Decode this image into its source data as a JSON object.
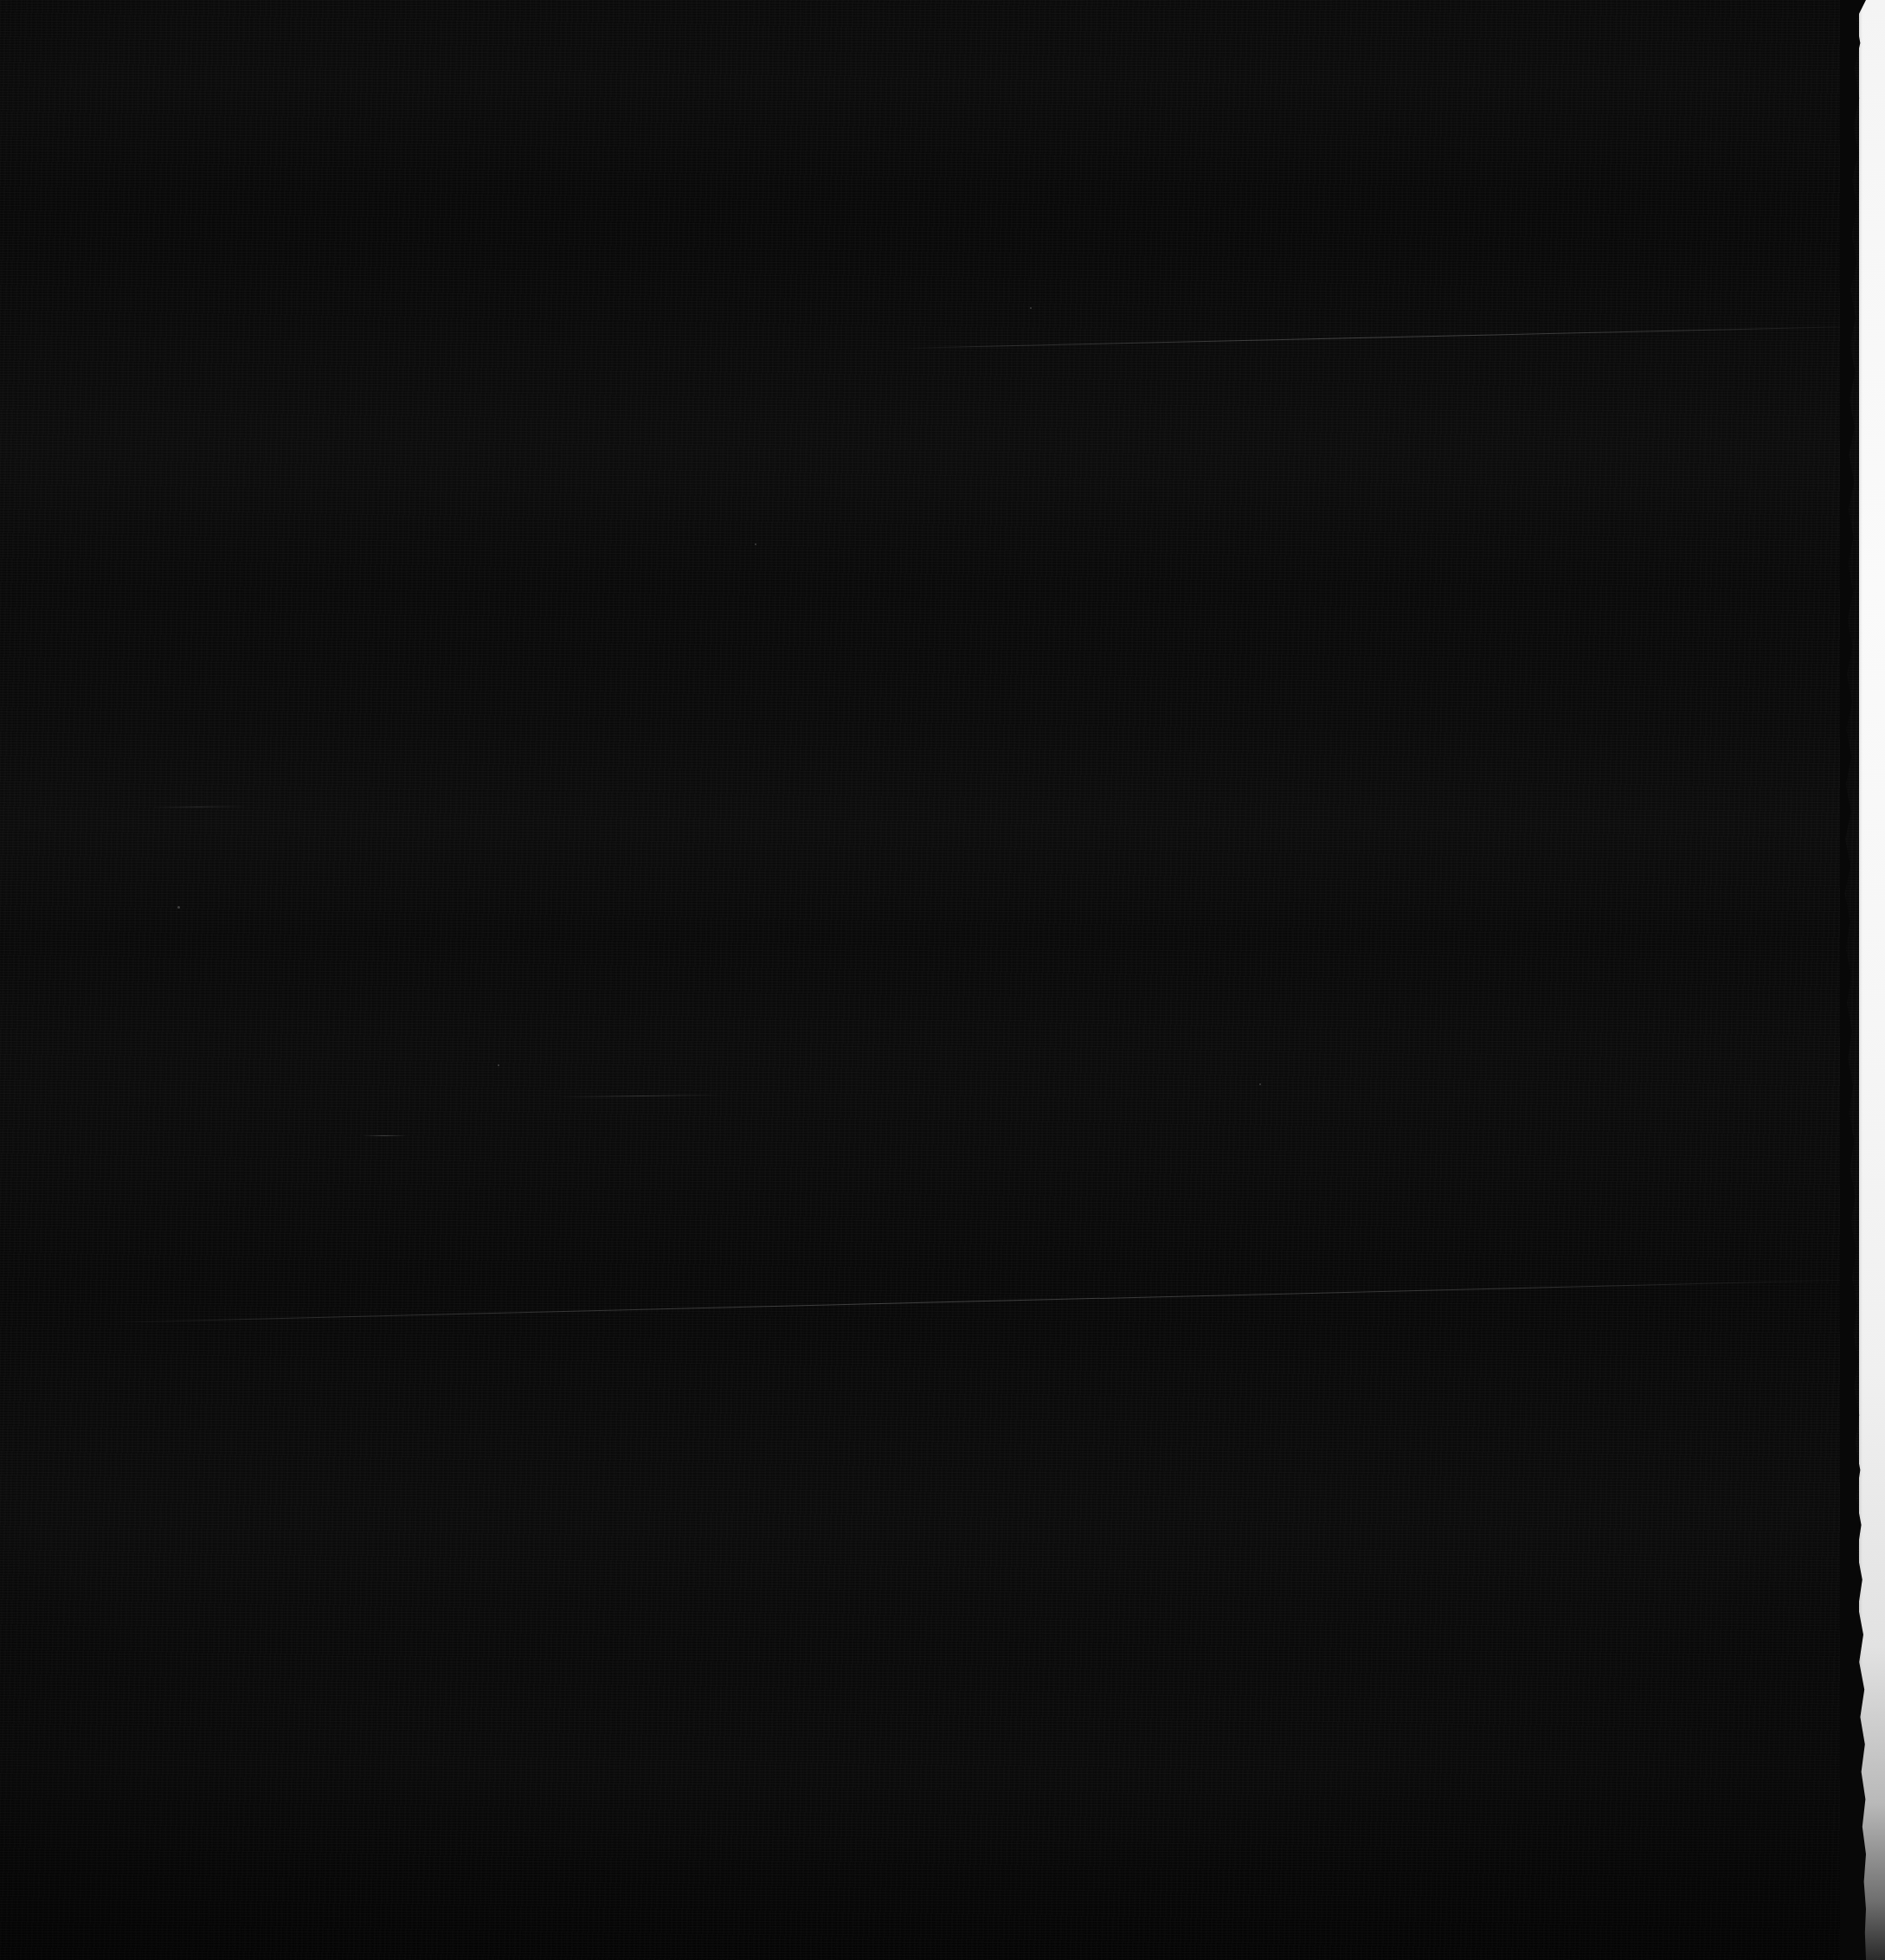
{
  "image": {
    "kind": "scanned-film-frame",
    "width": 2178,
    "height": 2265,
    "overall_description": "Almost entirely black photographic frame with a bright white film border along the right edge",
    "visible_text": "",
    "dominant_color": "#080808"
  },
  "field": {
    "name": "dark-exposure-field",
    "base_color": "#080808",
    "min_level": "#050505",
    "max_level": "#0c0c0c",
    "texture": "horizontal film grain / scan lines",
    "label": ""
  },
  "border_strip": {
    "name": "film-border-strip",
    "side": "right",
    "top_color": "#f4f4f4",
    "mid_color": "#fafafa",
    "bottom_color": "#2a2a2a",
    "approx_left_edge_x": 2150,
    "approx_width_px": 28,
    "edge_quality": "ragged / torn",
    "label": ""
  },
  "artifacts": {
    "scratches": [
      {
        "name": "scratch-upper",
        "start_x": 1040,
        "start_y": 402,
        "end_x": 2160,
        "end_y": 376,
        "brightness": "#3a3a3a",
        "label": ""
      },
      {
        "name": "scratch-lower",
        "start_x": 120,
        "start_y": 1528,
        "end_x": 2160,
        "end_y": 1478,
        "brightness": "#3a3a3a",
        "label": ""
      },
      {
        "name": "scratch-short-a",
        "start_x": 645,
        "start_y": 1266,
        "end_x": 835,
        "end_y": 1264,
        "brightness": "#2e2e2e",
        "label": ""
      },
      {
        "name": "scratch-short-b",
        "start_x": 418,
        "start_y": 1312,
        "end_x": 470,
        "end_y": 1312,
        "brightness": "#343434",
        "label": ""
      },
      {
        "name": "scratch-short-c",
        "start_x": 175,
        "start_y": 932,
        "end_x": 285,
        "end_y": 931,
        "brightness": "#262626",
        "label": ""
      }
    ],
    "specks": [
      {
        "name": "dust-speck",
        "x": 205,
        "y": 1047,
        "size": 3
      },
      {
        "name": "dust-speck",
        "x": 575,
        "y": 1230,
        "size": 2
      },
      {
        "name": "dust-speck",
        "x": 1455,
        "y": 1252,
        "size": 2
      },
      {
        "name": "dust-speck",
        "x": 872,
        "y": 628,
        "size": 2
      },
      {
        "name": "dust-speck",
        "x": 1190,
        "y": 355,
        "size": 2
      }
    ]
  }
}
